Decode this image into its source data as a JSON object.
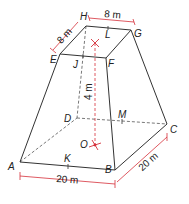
{
  "diagram": {
    "type": "frustum of square pyramid",
    "colors": {
      "edge": "#333333",
      "dimension": "#d6303a",
      "hidden": "#555555"
    },
    "vertices": {
      "A": "A",
      "B": "B",
      "C": "C",
      "D": "D",
      "E": "E",
      "F": "F",
      "G": "G",
      "H": "H"
    },
    "points": {
      "J": "J",
      "L": "L",
      "M": "M",
      "K": "K",
      "O": "O"
    },
    "dimensions": {
      "top_side_HG": "8 m",
      "top_side_EH": "8 m",
      "height": "4 m",
      "base_side_AB": "20 m",
      "base_side_BC": "20 m"
    }
  }
}
